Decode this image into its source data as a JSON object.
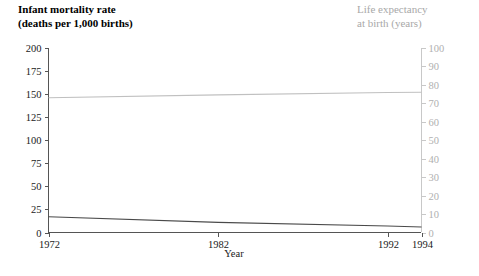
{
  "titles": {
    "left_line1": "Infant mortality rate",
    "left_line2": "(deaths per 1,000 births)",
    "right_line1": "Life expectancy",
    "right_line2": "at birth (years)"
  },
  "colors": {
    "mortality_line": "#4a4a4a",
    "life_line": "#c0c0c0",
    "left_axis": "#555555",
    "right_axis": "#c8c8c8",
    "right_title": "#a8a8a8",
    "background": "#ffffff"
  },
  "chart_data": {
    "type": "line",
    "title": "Infant mortality rate (deaths per 1,000 births)",
    "title_secondary": "Life expectancy at birth (years)",
    "xlabel": "Year",
    "ylabel": "Infant mortality rate (deaths per 1,000 births)",
    "ylabel_right": "Life expectancy at birth (years)",
    "xlim": [
      1972,
      1994
    ],
    "ylim": [
      0,
      200
    ],
    "ylim_right": [
      0,
      100
    ],
    "grid": false,
    "legend": "none",
    "xticks": [
      1972,
      1982,
      1992,
      1994
    ],
    "xticklabels": [
      "1972",
      "1982",
      "1992",
      "1994"
    ],
    "yticks": [
      0,
      25,
      50,
      75,
      100,
      125,
      150,
      175,
      200
    ],
    "yticklabels": [
      "0",
      "25",
      "50",
      "75",
      "100",
      "125",
      "150",
      "175",
      "200"
    ],
    "yticks_right": [
      0,
      10,
      20,
      30,
      40,
      50,
      60,
      70,
      80,
      90,
      100
    ],
    "yticklabels_right": [
      "0",
      "10",
      "20",
      "30",
      "40",
      "50",
      "60",
      "70",
      "80",
      "90",
      "100"
    ],
    "x": [
      1972,
      1982,
      1992,
      1994
    ],
    "series": [
      {
        "name": "Infant mortality rate",
        "axis": "left",
        "color": "#4a4a4a",
        "values": [
          17,
          11,
          7,
          6
        ]
      },
      {
        "name": "Life expectancy at birth",
        "axis": "right",
        "color": "#c0c0c0",
        "values": [
          73.0,
          74.6,
          75.9,
          76.0
        ]
      }
    ]
  }
}
